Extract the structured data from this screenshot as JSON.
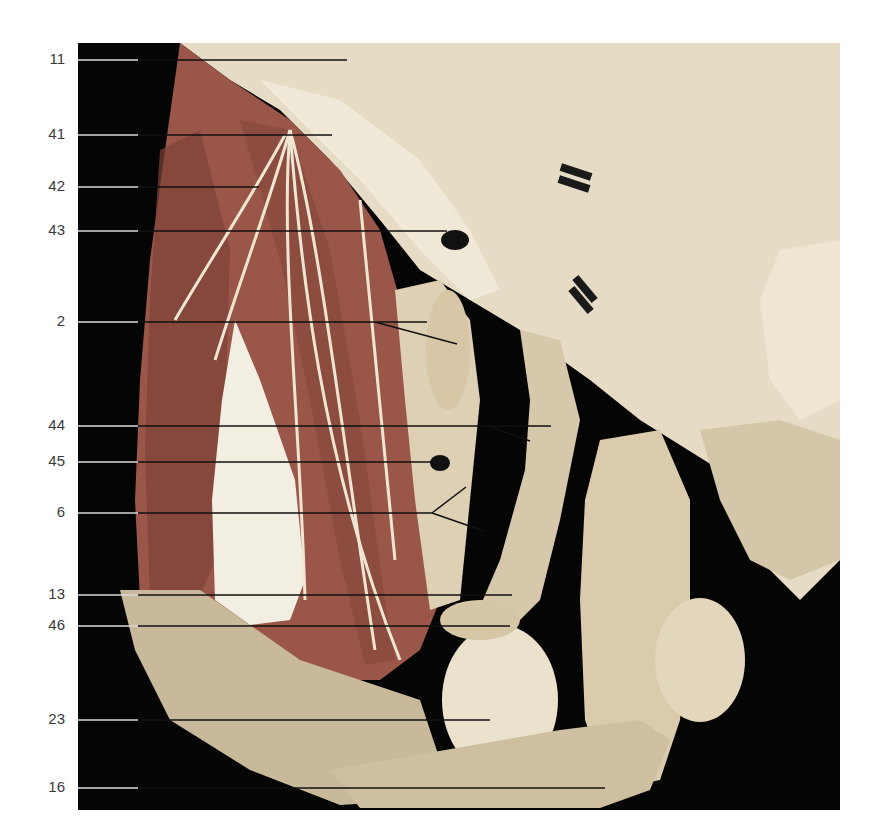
{
  "figure": {
    "frame": {
      "x": 78,
      "y": 43,
      "width": 762,
      "height": 767
    },
    "colors": {
      "background": "#050505",
      "page": "#ffffff",
      "muscle": "#9a5648",
      "muscle_dark": "#7e4238",
      "tissue_light": "#e6dcc6",
      "tissue_mid": "#cfc2a4",
      "skin_flap": "#c9b99b",
      "nerve": "#efe6d2",
      "tendon": "#f2eee2",
      "label_text": "#3a3a3a",
      "leader_on_dark": "#d8d8d8",
      "leader_on_tissue": "#111111",
      "marker": "#1a1a1a"
    },
    "labels": [
      {
        "id": "11",
        "text": "11",
        "y": 60,
        "end_x": 347,
        "branches": []
      },
      {
        "id": "41",
        "text": "41",
        "y": 135,
        "end_x": 332,
        "branches": []
      },
      {
        "id": "42",
        "text": "42",
        "y": 187,
        "end_x": 259,
        "branches": []
      },
      {
        "id": "43",
        "text": "43",
        "y": 231,
        "end_x": 447,
        "branches": []
      },
      {
        "id": "2",
        "text": "2",
        "y": 322,
        "end_x": 427,
        "branches": [
          {
            "from_x": 375,
            "to_x": 457,
            "to_y": 344
          }
        ]
      },
      {
        "id": "44",
        "text": "44",
        "y": 426,
        "end_x": 551,
        "branches": [
          {
            "from_x": 488,
            "to_x": 530,
            "to_y": 441
          }
        ]
      },
      {
        "id": "45",
        "text": "45",
        "y": 462,
        "end_x": 437,
        "branches": []
      },
      {
        "id": "6",
        "text": "6",
        "y": 513,
        "end_x": 432,
        "branches": [
          {
            "from_x": 432,
            "to_x": 466,
            "to_y": 487
          },
          {
            "from_x": 432,
            "to_x": 484,
            "to_y": 531
          }
        ]
      },
      {
        "id": "13",
        "text": "13",
        "y": 595,
        "end_x": 512,
        "branches": []
      },
      {
        "id": "46",
        "text": "46",
        "y": 626,
        "end_x": 510,
        "branches": []
      },
      {
        "id": "23",
        "text": "23",
        "y": 720,
        "end_x": 490,
        "branches": []
      },
      {
        "id": "16",
        "text": "16",
        "y": 788,
        "end_x": 605,
        "branches": []
      }
    ],
    "markers": [
      {
        "x": 560,
        "y": 168,
        "w": 32,
        "h": 8,
        "angle": 18
      },
      {
        "x": 558,
        "y": 180,
        "w": 32,
        "h": 8,
        "angle": 18
      },
      {
        "x": 570,
        "y": 285,
        "w": 30,
        "h": 8,
        "angle": 50
      },
      {
        "x": 566,
        "y": 296,
        "w": 30,
        "h": 8,
        "angle": 50
      }
    ]
  }
}
